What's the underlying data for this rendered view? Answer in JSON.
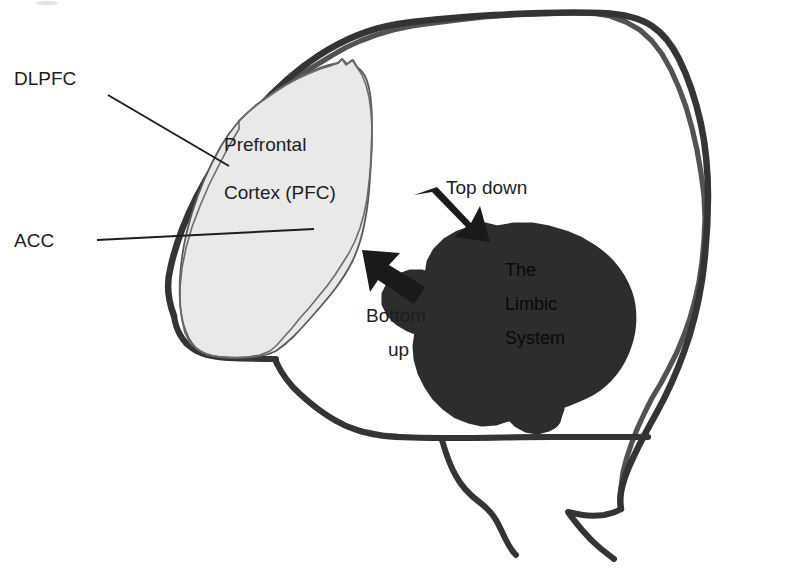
{
  "figure": {
    "kind": "brain-schematic-diagram",
    "background_color": "#ffffff",
    "outline_color": "#343434",
    "pfc_fill_color": "#e9e9e9",
    "pfc_outline_color": "#5a5a5a",
    "limbic_fill_color": "#2d2d2d",
    "label_color": "#1d1d1d",
    "limbic_label_color": "#080808"
  },
  "labels": {
    "dlpfc": "DLPFC",
    "acc": "ACC",
    "pfc_line1": "Prefrontal",
    "pfc_line2": "Cortex (PFC)",
    "top_down": "Top down",
    "bottom_up_line1": "Bottom",
    "bottom_up_line2": "up",
    "limbic_line1": "The",
    "limbic_line2": "Limbic",
    "limbic_line3": "System"
  },
  "regions": [
    {
      "id": "prefrontal-cortex",
      "name": "Prefrontal Cortex (PFC)",
      "fill": "#e9e9e9"
    },
    {
      "id": "limbic-system",
      "name": "The Limbic System",
      "fill": "#2d2d2d"
    }
  ],
  "annotations": [
    {
      "id": "dlpfc",
      "text": "DLPFC",
      "points_to": "prefrontal-cortex"
    },
    {
      "id": "acc",
      "text": "ACC",
      "points_to": "prefrontal-cortex"
    }
  ],
  "arrows": [
    {
      "id": "top-down-arrow",
      "label": "Top down",
      "from": "prefrontal-cortex",
      "to": "limbic-system",
      "direction": "down-right"
    },
    {
      "id": "bottom-up-arrow",
      "label": "Bottom up",
      "from": "limbic-system",
      "to": "prefrontal-cortex",
      "direction": "up-left"
    }
  ]
}
